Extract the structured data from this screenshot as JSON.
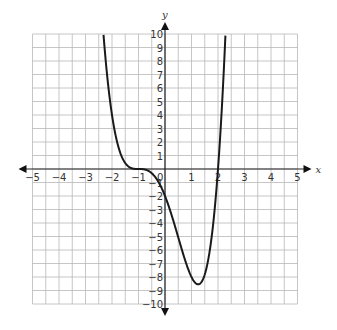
{
  "chart_data": {
    "type": "line",
    "title": "",
    "xlabel": "x",
    "ylabel": "y",
    "xlim": [
      -5,
      5
    ],
    "ylim": [
      -10,
      10
    ],
    "grid": true,
    "grid_step_x": 0.5,
    "grid_step_y": 1,
    "x_ticks": [
      -5,
      -4,
      -3,
      -2,
      -1,
      0,
      1,
      2,
      3,
      4,
      5
    ],
    "y_ticks": [
      -10,
      -9,
      -8,
      -7,
      -6,
      -5,
      -4,
      -3,
      -2,
      -1,
      1,
      2,
      3,
      4,
      5,
      6,
      7,
      8,
      9,
      10
    ],
    "x_tick_labels": [
      "−5",
      "−4",
      "−3",
      "−2",
      "−1",
      "0",
      "1",
      "2",
      "3",
      "4",
      "5"
    ],
    "y_tick_labels": [
      "−10",
      "−9",
      "−8",
      "−7",
      "−6",
      "−5",
      "−4",
      "−3",
      "−2",
      "−1",
      "1",
      "2",
      "3",
      "4",
      "5",
      "6",
      "7",
      "8",
      "9",
      "10"
    ],
    "series": [
      {
        "name": "curve",
        "description": "Quartic with triple root at x=-1 (flat inflection) and simple root at x=2; y-intercept -2; minimum near (1.25, -8.5); clipped at y=10",
        "points": [
          [
            -2.3,
            9.4
          ],
          [
            -2.0,
            4.0
          ],
          [
            -1.75,
            1.1
          ],
          [
            -1.5,
            0.44
          ],
          [
            -1.25,
            0.05
          ],
          [
            -1.0,
            0.0
          ],
          [
            -0.75,
            -0.04
          ],
          [
            -0.5,
            -0.31
          ],
          [
            -0.25,
            -0.88
          ],
          [
            0.0,
            -2.0
          ],
          [
            0.25,
            -3.66
          ],
          [
            0.5,
            -5.06
          ],
          [
            0.75,
            -6.97
          ],
          [
            1.0,
            -8.0
          ],
          [
            1.25,
            -8.54
          ],
          [
            1.5,
            -8.58
          ],
          [
            1.75,
            -4.9
          ],
          [
            2.0,
            0.0
          ],
          [
            2.2,
            5.9
          ],
          [
            2.4,
            10.0
          ]
        ],
        "color": "#1a1a1a"
      }
    ],
    "annotations": []
  },
  "labels": {
    "x_axis": "x",
    "y_axis": "y",
    "caption": ""
  }
}
